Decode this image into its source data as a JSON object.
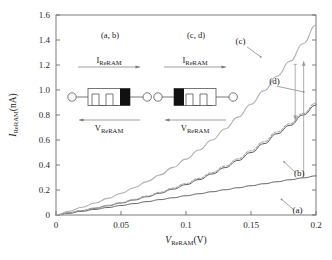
{
  "figure": {
    "background": "#ffffff",
    "frame_color": "#6e6e6e"
  },
  "chart_data": {
    "type": "line",
    "title": "",
    "xlabel": "V_ReRAM (V)",
    "ylabel": "I_ReRAM (nA)",
    "xlabel_parts": {
      "symbol": "V",
      "subscript": "ReRAM",
      "unit": "(V)"
    },
    "ylabel_parts": {
      "symbol": "I",
      "subscript": "ReRAM",
      "unit": "(nA)"
    },
    "xlim": [
      0,
      0.2
    ],
    "ylim": [
      0,
      1.6
    ],
    "xticks": [
      0,
      0.05,
      0.1,
      0.15,
      0.2
    ],
    "xticklabels": [
      "0",
      "0.05",
      "0.1",
      "0.15",
      "0.2"
    ],
    "yticks": [
      0,
      0.2,
      0.4,
      0.6,
      0.8,
      1.0,
      1.2,
      1.4,
      1.6
    ],
    "yticklabels": [
      "0",
      "0.2",
      "0.4",
      "0.6",
      "0.8",
      "1.0",
      "1.2",
      "1.4",
      "1.6"
    ],
    "grid": false,
    "legend": "none",
    "x": [
      0,
      0.01,
      0.02,
      0.03,
      0.04,
      0.05,
      0.06,
      0.07,
      0.08,
      0.09,
      0.1,
      0.11,
      0.12,
      0.13,
      0.14,
      0.15,
      0.16,
      0.17,
      0.18,
      0.19,
      0.2
    ],
    "series": [
      {
        "name": "a",
        "label": "(a)",
        "color": "#555555",
        "style": "solid",
        "values": [
          0,
          0.015,
          0.03,
          0.045,
          0.06,
          0.076,
          0.091,
          0.107,
          0.123,
          0.138,
          0.154,
          0.17,
          0.186,
          0.202,
          0.218,
          0.234,
          0.25,
          0.266,
          0.282,
          0.297,
          0.313
        ]
      },
      {
        "name": "b",
        "label": "(b)",
        "color": "#4a4a4a",
        "style": "solid",
        "values": [
          0,
          0.017,
          0.035,
          0.054,
          0.074,
          0.096,
          0.12,
          0.146,
          0.175,
          0.207,
          0.243,
          0.283,
          0.328,
          0.379,
          0.436,
          0.5,
          0.571,
          0.65,
          0.717,
          0.8,
          0.88
        ]
      },
      {
        "name": "c",
        "label": "(c)",
        "color": "#b0b0b0",
        "style": "solid",
        "values": [
          0,
          0.03,
          0.062,
          0.096,
          0.133,
          0.173,
          0.218,
          0.267,
          0.321,
          0.381,
          0.447,
          0.52,
          0.6,
          0.688,
          0.783,
          0.886,
          0.995,
          1.11,
          1.23,
          1.37,
          1.52
        ]
      },
      {
        "name": "d",
        "label": "(d)",
        "color": "#a8a8a8",
        "style": "dashed",
        "values": [
          0,
          0.018,
          0.036,
          0.056,
          0.077,
          0.1,
          0.125,
          0.152,
          0.182,
          0.215,
          0.252,
          0.293,
          0.339,
          0.391,
          0.449,
          0.514,
          0.586,
          0.664,
          0.73,
          0.812,
          0.895
        ]
      }
    ],
    "annotations": [
      {
        "id": "label-a",
        "text": "(a)",
        "x": 0.1735,
        "y": 0.125
      },
      {
        "id": "label-b",
        "text": "(b)",
        "x": 0.1755,
        "y": 0.425
      },
      {
        "id": "label-c",
        "text": "(c)",
        "x": 0.1575,
        "y": 1.265
      },
      {
        "id": "label-d",
        "text": "(d)",
        "x": 0.1905,
        "y": 0.985
      },
      {
        "id": "arrow-down",
        "text": "",
        "x": 0.184,
        "y_from": 1.205,
        "y_to": 0.76,
        "direction": "down"
      },
      {
        "id": "arrow-up",
        "text": "",
        "x": 0.1905,
        "y_from": 0.3,
        "y_to": 1.23,
        "direction": "up"
      }
    ]
  },
  "insets": [
    {
      "id": "inset-ab",
      "caption": "(a, b)",
      "current_label": {
        "symbol": "I",
        "subscript": "ReRAM"
      },
      "voltage_label": {
        "symbol": "V",
        "subscript": "ReRAM"
      },
      "current_arrow_direction": "right",
      "voltage_arrow_direction": "left",
      "polarity_bar_side": "right",
      "device": "memristor"
    },
    {
      "id": "inset-cd",
      "caption": "(c, d)",
      "current_label": {
        "symbol": "I",
        "subscript": "ReRAM"
      },
      "voltage_label": {
        "symbol": "V",
        "subscript": "ReRAM"
      },
      "current_arrow_direction": "right",
      "voltage_arrow_direction": "left",
      "polarity_bar_side": "left",
      "device": "memristor"
    }
  ]
}
